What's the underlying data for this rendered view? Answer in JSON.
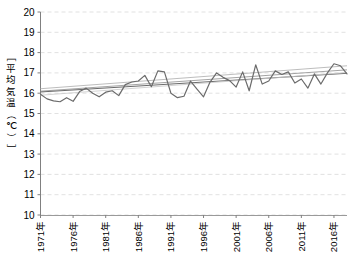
{
  "chart_data": {
    "type": "line",
    "title": "",
    "subtitle": "",
    "xlabel": "",
    "ylabel": "［平均気温（℃）］",
    "ylim": [
      10,
      20
    ],
    "ytick_labels": [
      "20",
      "19",
      "18",
      "17",
      "16",
      "15",
      "14",
      "13",
      "12",
      "11",
      "10"
    ],
    "ytick_values": [
      20,
      19,
      18,
      17,
      16,
      15,
      14,
      13,
      12,
      11,
      10
    ],
    "grid": true,
    "grid_style": "dashed",
    "legend": "none",
    "x": [
      1971,
      1972,
      1973,
      1974,
      1975,
      1976,
      1977,
      1978,
      1979,
      1980,
      1981,
      1982,
      1983,
      1984,
      1985,
      1986,
      1987,
      1988,
      1989,
      1990,
      1991,
      1992,
      1993,
      1994,
      1995,
      1996,
      1997,
      1998,
      1999,
      2000,
      2001,
      2002,
      2003,
      2004,
      2005,
      2006,
      2007,
      2008,
      2009,
      2010,
      2011,
      2012,
      2013,
      2014,
      2015,
      2016,
      2017,
      2018
    ],
    "xtick_labels": [
      "1971年",
      "1976年",
      "1981年",
      "1986年",
      "1991年",
      "1996年",
      "2001年",
      "2006年",
      "2011年",
      "2016年"
    ],
    "xtick_values": [
      1971,
      1976,
      1981,
      1986,
      1991,
      1996,
      2001,
      2006,
      2011,
      2016
    ],
    "xtick_rotation": -90,
    "series": [
      {
        "name": "年平均気温",
        "color": "#6b6b6b",
        "width": 1.2,
        "values": [
          15.95,
          15.72,
          15.62,
          15.58,
          15.78,
          15.6,
          16.08,
          16.25,
          16.0,
          15.82,
          16.05,
          16.12,
          15.88,
          16.42,
          16.55,
          16.6,
          16.88,
          16.32,
          17.1,
          17.05,
          16.0,
          15.78,
          15.85,
          16.6,
          16.2,
          15.82,
          16.55,
          17.0,
          16.78,
          16.62,
          16.3,
          17.05,
          16.12,
          17.4,
          16.45,
          16.6,
          17.1,
          16.92,
          17.05,
          16.5,
          16.7,
          16.25,
          16.95,
          16.45,
          17.0,
          17.45,
          17.35,
          16.95
        ]
      }
    ],
    "trendlines": [
      {
        "name": "trend-upper",
        "color": "#b5b5b5",
        "width": 0.9,
        "from": [
          1971,
          16.22
        ],
        "to": [
          2018,
          17.35
        ]
      },
      {
        "name": "trend-middle",
        "color": "#9a9a9a",
        "width": 0.9,
        "from": [
          1971,
          16.1
        ],
        "to": [
          2018,
          17.15
        ]
      },
      {
        "name": "trend-lower",
        "color": "#6b6b6b",
        "width": 1.0,
        "from": [
          1971,
          16.06
        ],
        "to": [
          2018,
          16.98
        ]
      },
      {
        "name": "trend-faint",
        "color": "#c8c8c8",
        "width": 0.8,
        "from": [
          1971,
          15.9
        ],
        "to": [
          2018,
          17.02
        ]
      }
    ],
    "colors": {
      "series": "#6b6b6b",
      "grid": "#d9d9d9",
      "axis": "#808080",
      "text": "#000000",
      "background": "#ffffff"
    }
  }
}
